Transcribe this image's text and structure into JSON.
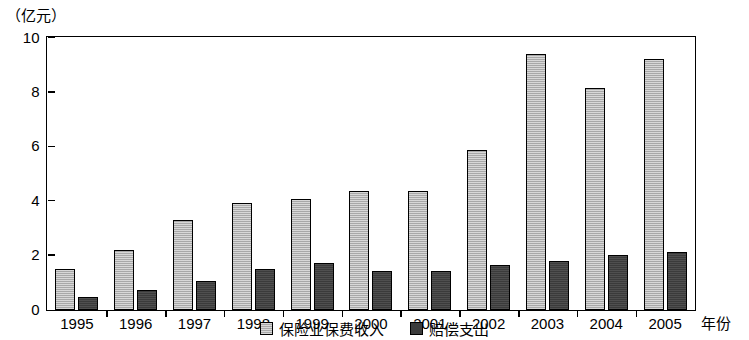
{
  "chart_data": {
    "type": "bar",
    "title": "",
    "subtitle": "",
    "unit_label": "（亿元）",
    "xlabel": "年份",
    "ylabel": "",
    "ylim": [
      0,
      10
    ],
    "ytick_labels": [
      "0",
      "2",
      "4",
      "6",
      "8",
      "10"
    ],
    "ytick_values": [
      0,
      2,
      4,
      6,
      8,
      10
    ],
    "grid": false,
    "legend_position": "bottom-center",
    "categories": [
      "1995",
      "1996",
      "1997",
      "1998",
      "1999",
      "2000",
      "2001",
      "2002",
      "2003",
      "2004",
      "2005"
    ],
    "series": [
      {
        "name": "保险业保费收入",
        "color": "#a8a8a8",
        "values": [
          1.5,
          2.2,
          3.3,
          3.9,
          4.05,
          4.35,
          4.35,
          5.85,
          9.4,
          8.15,
          9.2
        ]
      },
      {
        "name": "赔偿支出",
        "color": "#3b3b3b",
        "values": [
          0.45,
          0.7,
          1.05,
          1.5,
          1.7,
          1.4,
          1.4,
          1.65,
          1.8,
          2.0,
          2.1
        ]
      }
    ]
  }
}
